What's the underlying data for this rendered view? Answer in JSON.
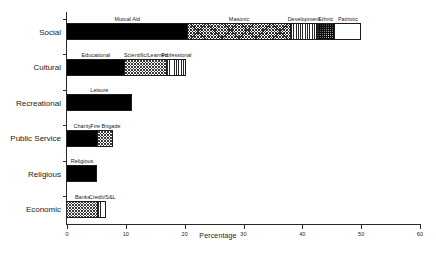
{
  "chart_data": {
    "type": "bar",
    "orientation": "horizontal",
    "stacked": true,
    "title": "",
    "xlabel": "Percentage",
    "ylabel": "",
    "xlim": [
      0,
      60
    ],
    "xticks": [
      0,
      10,
      20,
      30,
      40,
      50,
      60
    ],
    "xticklabels": [
      "0",
      "10",
      "20",
      "30",
      "40",
      "50",
      "60"
    ],
    "grid": false,
    "legend": "none (segments labeled inline above each bar)",
    "categories": [
      "Social",
      "Cultural",
      "Recreational",
      "Public Service",
      "Religious",
      "Economic"
    ],
    "rows": [
      {
        "category": "Social",
        "total": 50.0,
        "segments": [
          {
            "label": "Mutual Aid",
            "value": 20.5,
            "pattern": "solid-black"
          },
          {
            "label": "Masonic",
            "value": 17.5,
            "pattern": "fine-crosshatch"
          },
          {
            "label": "Development",
            "value": 4.5,
            "pattern": "vertical-lines"
          },
          {
            "label": "Ethnic",
            "value": 3.0,
            "pattern": "dark-dotted"
          },
          {
            "label": "Patriotic",
            "value": 4.5,
            "pattern": "stipple"
          }
        ]
      },
      {
        "category": "Cultural",
        "total": 20.2,
        "segments": [
          {
            "label": "Educational",
            "value": 9.8,
            "pattern": "solid-black"
          },
          {
            "label": "Scientific/Learned",
            "value": 7.2,
            "pattern": "crosshatch"
          },
          {
            "label": "Professional",
            "value": 3.2,
            "pattern": "vertical-lines"
          }
        ]
      },
      {
        "category": "Recreational",
        "total": 11.0,
        "segments": [
          {
            "label": "Leisure",
            "value": 11.0,
            "pattern": "solid-black"
          }
        ]
      },
      {
        "category": "Public Service",
        "total": 7.9,
        "segments": [
          {
            "label": "Charity",
            "value": 5.2,
            "pattern": "solid-black"
          },
          {
            "label": "Fire Brigade",
            "value": 2.7,
            "pattern": "crosshatch"
          }
        ]
      },
      {
        "category": "Religious",
        "total": 5.1,
        "segments": [
          {
            "label": "Religious",
            "value": 5.1,
            "pattern": "solid-black"
          }
        ]
      },
      {
        "category": "Economic",
        "total": 6.7,
        "segments": [
          {
            "label": "Banks",
            "value": 5.3,
            "pattern": "crosshatch"
          },
          {
            "label": "Credit/S&L",
            "value": 1.4,
            "pattern": "vertical-lines"
          }
        ]
      }
    ]
  }
}
